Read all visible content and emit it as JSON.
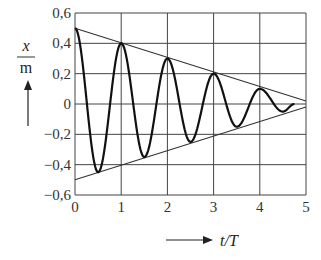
{
  "chart_data": {
    "type": "line",
    "title": "",
    "xlabel": "t/T",
    "ylabel": "x / m",
    "xlim": [
      0,
      5
    ],
    "ylim": [
      -0.6,
      0.6
    ],
    "grid": true,
    "x_ticks": [
      "0",
      "1",
      "2",
      "3",
      "4",
      "5"
    ],
    "y_ticks": [
      "0,6",
      "0,4",
      "0,2",
      "0",
      "−0,2",
      "−0,4",
      "−0,6"
    ],
    "series": [
      {
        "name": "damped oscillation x(t)",
        "description": "Linearly damped oscillation, amplitude decreasing by 0.05 m per half period",
        "x": [
          0,
          0.5,
          1,
          1.5,
          2,
          2.5,
          3,
          3.5,
          4,
          4.5,
          4.75
        ],
        "values": [
          0.5,
          -0.45,
          0.4,
          -0.35,
          0.3,
          -0.25,
          0.2,
          -0.15,
          0.1,
          -0.05,
          0.0
        ]
      },
      {
        "name": "upper envelope",
        "x": [
          0,
          5
        ],
        "values": [
          0.5,
          0.02
        ]
      },
      {
        "name": "lower envelope",
        "x": [
          0,
          5
        ],
        "values": [
          -0.5,
          -0.02
        ]
      }
    ]
  },
  "axes": {
    "y_label_top": "x",
    "y_label_bottom": "m",
    "x_label": "t/T"
  }
}
